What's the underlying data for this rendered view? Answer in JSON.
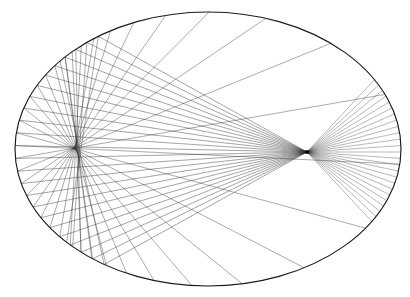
{
  "figure": {
    "type": "geometric-optics-diagram",
    "background_color": "#ffffff",
    "canvas": {
      "width": 410,
      "height": 297
    },
    "ellipse": {
      "name": "ellipse-boundary",
      "center_x": 208,
      "center_y": 149,
      "rx": 193,
      "ry": 137,
      "stroke_color": "#1a1a1a",
      "stroke_width": 1.15,
      "fill": "none"
    },
    "focus": {
      "name": "right-focus-point",
      "x": 307,
      "y": 152,
      "radius": 2.1,
      "color": "#000000",
      "label": ""
    },
    "rays": {
      "name": "reflected-ray-bundle",
      "stroke_color": "#2b2b2b",
      "stroke_width": 0.55,
      "count": 26,
      "description": "Rays emitted from the right focus, striking the left arc of the ellipse and reflecting back toward the focus",
      "left_band": {
        "x_min": 15,
        "y_top": 120,
        "y_bottom": 181
      },
      "right_fan": {
        "y_top": 88,
        "y_bottom": 217
      },
      "angles_deg_from_focus": [
        148,
        152,
        156,
        160,
        164,
        168,
        172,
        176,
        180,
        184,
        188,
        192,
        196,
        200,
        204,
        208,
        212,
        -40,
        -33,
        -26,
        -19,
        -12,
        -5,
        2,
        9,
        16,
        23,
        30,
        37,
        44
      ]
    },
    "chart_data": {
      "type": "scatter",
      "title": "Ellipse reflection ray diagram",
      "xlabel": "",
      "ylabel": "",
      "xlim": [
        15,
        401
      ],
      "ylim": [
        12,
        286
      ],
      "grid": false,
      "legend": "none",
      "series": [
        {
          "name": "ellipse-outline",
          "center": [
            208,
            149
          ],
          "semi_axes": [
            193,
            137
          ]
        },
        {
          "name": "ray-source",
          "points": [
            [
              307,
              152
            ]
          ]
        }
      ]
    }
  }
}
